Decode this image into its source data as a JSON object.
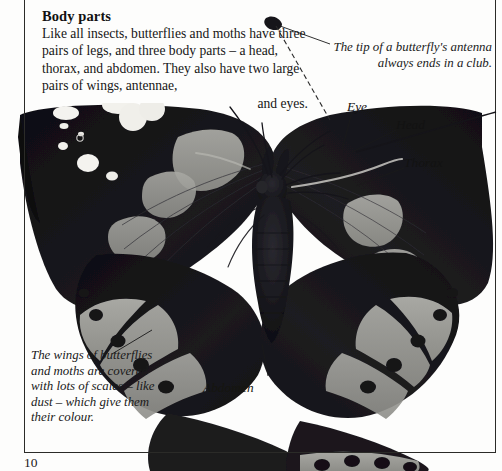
{
  "page": {
    "number": "10",
    "heading": "Body parts",
    "body_text": "Like all insects, butterflies and moths have three pairs of legs, and three body parts – a head, thorax, and abdomen. They also have two large pairs of wings, antennae,",
    "body_text_last_line": "and eyes."
  },
  "callouts": {
    "antenna": "The tip of a butterfly's antenna always ends in a club.",
    "scales": "The wings of butterflies and moths are covered with lots of scales – like dust – which give them their colour."
  },
  "labels": {
    "eye": "Eye",
    "head": "Head",
    "thorax": "Thorax",
    "abdomen": "Abdomen"
  },
  "photo": {
    "subject": "butterfly-specimen-photograph",
    "description": "Black and white photograph of a butterfly with wings spread, showing white spots on forewing tips and pale grey bands with dark spots along wing margins",
    "colors": {
      "wing_dark": "#17161a",
      "wing_band": "#9a9a96",
      "wing_spot_white": "#f4f3ef",
      "body_dark": "#1b1a1d",
      "background": "#fdfdfc"
    }
  },
  "rules": {
    "border_color": "#2b2b28"
  }
}
